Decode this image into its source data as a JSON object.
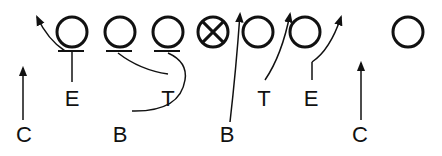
{
  "diagram": {
    "type": "football-play",
    "colors": {
      "ink": "#111111",
      "background": "#ffffff"
    },
    "line_of_scrimmage": {
      "players": [
        {
          "id": "o1",
          "symbol": "circle"
        },
        {
          "id": "o2",
          "symbol": "circle"
        },
        {
          "id": "o3",
          "symbol": "circle"
        },
        {
          "id": "ball",
          "symbol": "circle-x"
        },
        {
          "id": "o5",
          "symbol": "circle"
        },
        {
          "id": "o6",
          "symbol": "circle"
        },
        {
          "id": "o7",
          "symbol": "circle"
        }
      ]
    },
    "labels": {
      "left_end": "E",
      "left_tackle": "T",
      "right_tackle": "T",
      "right_end": "E",
      "left_back": "B",
      "right_back": "B",
      "left_corner": "C",
      "right_corner": "C"
    }
  }
}
